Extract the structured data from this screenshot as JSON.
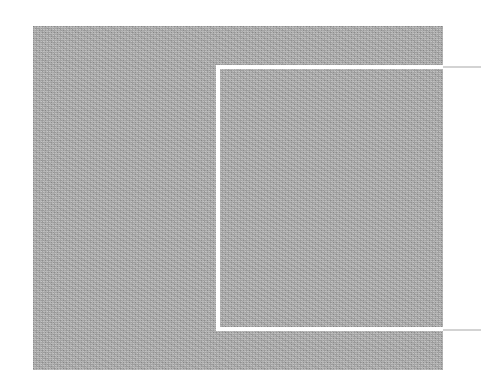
{
  "canvas": {
    "width": 482,
    "height": 370,
    "background_color": "#ffffff"
  },
  "image_block": {
    "label": "grey-textured-image-region",
    "x": 33,
    "y": 26,
    "width": 410,
    "height": 344,
    "fill_color": "#a9a9a9",
    "texture": "fine-dithered-noise"
  },
  "callout_rect": {
    "label": "crop-selection-rectangle",
    "x": 216,
    "y": 65,
    "width": 227,
    "height": 266,
    "stroke_color": "#ffffff",
    "stroke_width": 4,
    "open_side": "right"
  },
  "leader_lines": [
    {
      "label": "top-leader-line",
      "x": 443,
      "y": 66,
      "width": 38,
      "color": "#d3d3d3"
    },
    {
      "label": "bottom-leader-line",
      "x": 443,
      "y": 329,
      "width": 38,
      "color": "#d3d3d3"
    }
  ]
}
